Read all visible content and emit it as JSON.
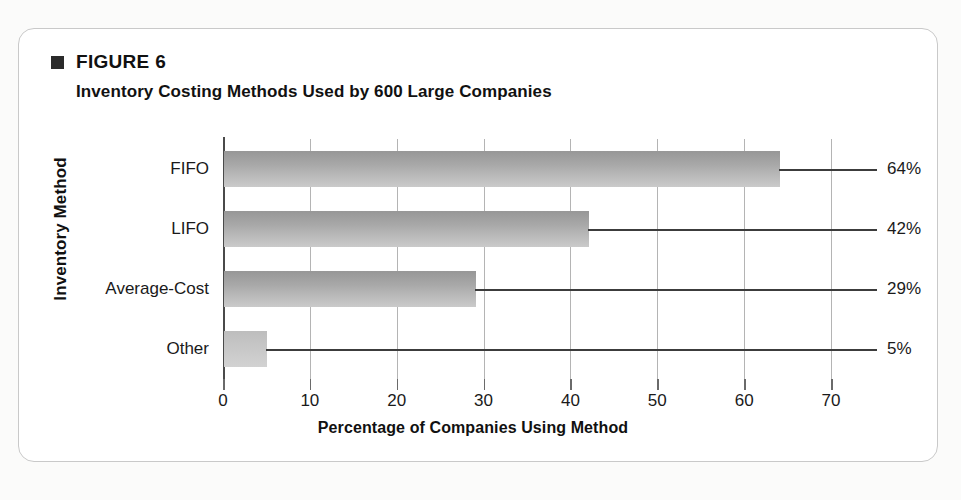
{
  "figure": {
    "label": "FIGURE 6",
    "marker_icon": "filled-square-icon",
    "subtitle": "Inventory Costing Methods Used by 600 Large Companies"
  },
  "chart_data": {
    "type": "bar",
    "orientation": "horizontal",
    "title": "Inventory Costing Methods Used by 600 Large Companies",
    "categories": [
      "FIFO",
      "LIFO",
      "Average-Cost",
      "Other"
    ],
    "values": [
      64,
      42,
      29,
      5
    ],
    "value_labels": [
      "64%",
      "42%",
      "29%",
      "5%"
    ],
    "xlabel": "Percentage of Companies Using Method",
    "ylabel": "Inventory Method",
    "xlim": [
      0,
      70
    ],
    "xticks": [
      0,
      10,
      20,
      30,
      40,
      50,
      60,
      70
    ],
    "xtick_labels": [
      "0",
      "10",
      "20",
      "30",
      "40",
      "50",
      "60",
      "70"
    ],
    "grid": true,
    "legend": "none",
    "bar_color": "#a8a8a8",
    "bar_color_light": "#c6c6c6",
    "axis_color": "#4a4a4a",
    "gridline_color": "#b4b4b4"
  }
}
